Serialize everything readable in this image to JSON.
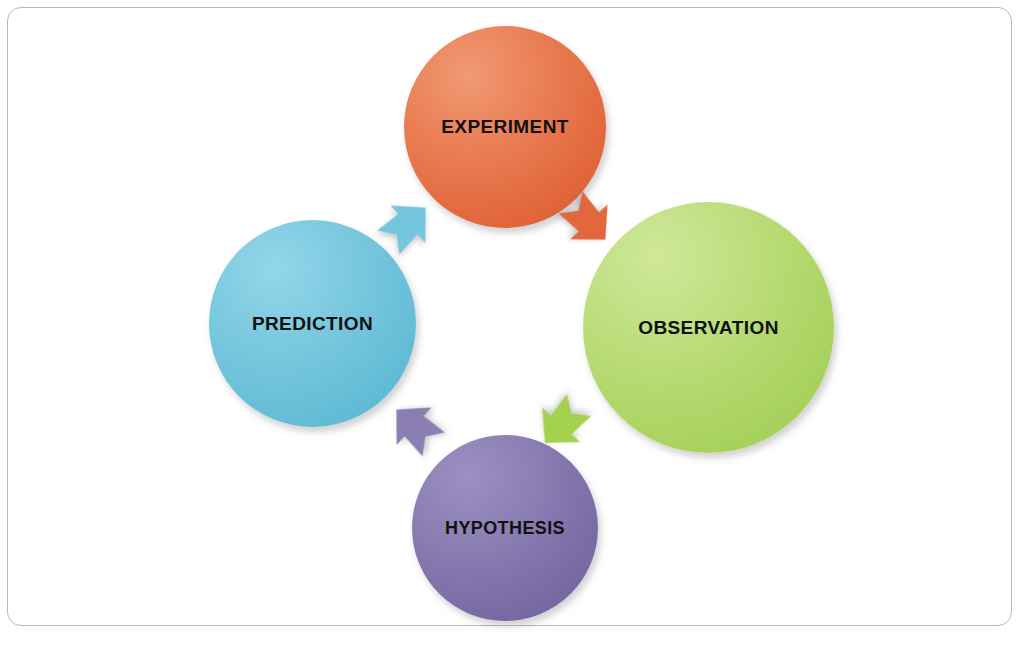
{
  "diagram": {
    "frame_color": "#b9b9b9",
    "background": "#ffffff",
    "nodes": [
      {
        "id": "experiment",
        "label": "EXPERIMENT",
        "position": "top",
        "color": "#e2673c",
        "highlight": "#f09a74",
        "diameter": 202
      },
      {
        "id": "observation",
        "label": "OBSERVATION",
        "position": "right",
        "color": "#a9d35f",
        "highlight": "#cfe89a",
        "diameter": 251
      },
      {
        "id": "hypothesis",
        "label": "HYPOTHESIS",
        "position": "bottom",
        "color": "#786aa4",
        "highlight": "#9b90c0",
        "diameter": 186
      },
      {
        "id": "prediction",
        "label": "PREDICTION",
        "position": "left",
        "color": "#63bcd6",
        "highlight": "#94d6e9",
        "diameter": 207
      }
    ],
    "arrows": [
      {
        "id": "prediction-to-experiment",
        "from": "prediction",
        "to": "experiment",
        "color": "#74c6de",
        "direction": "up-right"
      },
      {
        "id": "experiment-to-observation",
        "from": "experiment",
        "to": "observation",
        "color": "#e2673c",
        "direction": "down-right"
      },
      {
        "id": "observation-to-hypothesis",
        "from": "observation",
        "to": "hypothesis",
        "color": "#a4d24f",
        "direction": "down-left"
      },
      {
        "id": "hypothesis-to-prediction",
        "from": "hypothesis",
        "to": "prediction",
        "color": "#8a7eb3",
        "direction": "up-left"
      }
    ]
  }
}
